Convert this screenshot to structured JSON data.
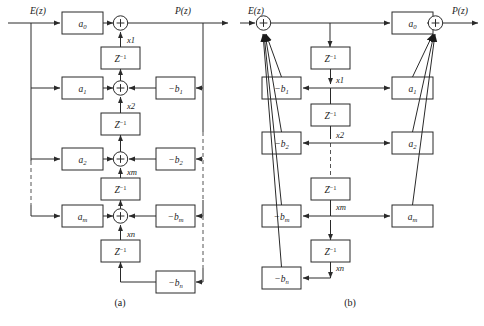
{
  "figure": {
    "type": "block-diagram",
    "captions": [
      {
        "id": "a",
        "text": "(a)"
      },
      {
        "id": "b",
        "text": "(b)"
      }
    ]
  },
  "symbols": {
    "input": "E(z)",
    "output": "P(z)",
    "delay": "Z",
    "delay_exponent": "−1",
    "sum": "+"
  },
  "diagram_a": {
    "name": "direct-form-structure",
    "input_label": "E(z)",
    "output_label": "P(z)",
    "feedforward_coefficients": [
      {
        "base": "a",
        "sub": "0"
      },
      {
        "base": "a",
        "sub": "1"
      },
      {
        "base": "a",
        "sub": "2"
      },
      {
        "base": "a",
        "sub": "m"
      }
    ],
    "feedback_coefficients": [
      {
        "base": "−b",
        "sub": "1"
      },
      {
        "base": "−b",
        "sub": "2"
      },
      {
        "base": "−b",
        "sub": "m"
      },
      {
        "base": "−b",
        "sub": "n"
      }
    ],
    "delay_blocks": [
      "Z",
      "Z",
      "Z",
      "Z"
    ],
    "state_labels": [
      "x1",
      "x2",
      "xm",
      "xn"
    ],
    "summing_nodes": 4,
    "ellipsis": "vertical dashed break between row 2 and row m"
  },
  "diagram_b": {
    "name": "canonical-form-structure",
    "input_label": "E(z)",
    "output_label": "P(z)",
    "feedforward_coefficients": [
      {
        "base": "a",
        "sub": "0"
      },
      {
        "base": "a",
        "sub": "1"
      },
      {
        "base": "a",
        "sub": "2"
      },
      {
        "base": "a",
        "sub": "m"
      }
    ],
    "feedback_coefficients": [
      {
        "base": "−b",
        "sub": "1"
      },
      {
        "base": "−b",
        "sub": "2"
      },
      {
        "base": "−b",
        "sub": "m"
      },
      {
        "base": "−b",
        "sub": "n"
      }
    ],
    "delay_blocks": [
      "Z",
      "Z",
      "Z",
      "Z"
    ],
    "state_labels": [
      "x1",
      "x2",
      "xm",
      "xn"
    ],
    "summing_nodes": 2,
    "ellipsis": "vertical dashed break between x2 row and xm row"
  },
  "colors": {
    "background": "#ffffff",
    "stroke": "#2a2a2a",
    "dashed": "#555555",
    "text": "#1a1a1a"
  }
}
